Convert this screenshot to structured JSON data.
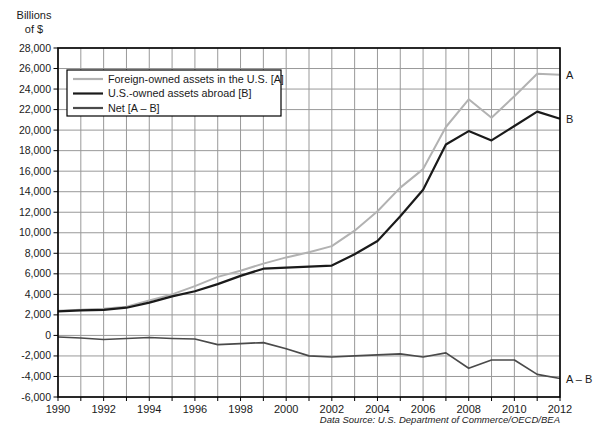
{
  "chart_data": {
    "type": "line",
    "title": "",
    "y_unit": "Billions\nof $",
    "ylabel": "Billions of $",
    "source": "Data Source: U.S. Department of Commerce/OECD/BEA",
    "x": [
      1990,
      1991,
      1992,
      1993,
      1994,
      1995,
      1996,
      1997,
      1998,
      1999,
      2000,
      2001,
      2002,
      2003,
      2004,
      2005,
      2006,
      2007,
      2008,
      2009,
      2010,
      2011,
      2012
    ],
    "x_label_step": 2,
    "ylim": [
      -6000,
      28000
    ],
    "ytick_step": 2000,
    "grid": true,
    "legend_position": "top-left",
    "colors": {
      "grid": "#999999",
      "axis": "#000000",
      "text": "#1a1a1a"
    },
    "series": [
      {
        "name": "Foreign-owned assets in the U.S. [A]",
        "end_label": "A",
        "color": "#b2b2b2",
        "width": 2.0,
        "values": [
          2400,
          2500,
          2600,
          2800,
          3400,
          4000,
          4800,
          5700,
          6300,
          7000,
          7600,
          8100,
          8700,
          10200,
          12100,
          14400,
          16200,
          20300,
          23000,
          21200,
          23300,
          25500,
          25400
        ]
      },
      {
        "name": "U.S.-owned assets abroad [B]",
        "end_label": "B",
        "color": "#1a1a1a",
        "width": 2.2,
        "values": [
          2350,
          2450,
          2500,
          2700,
          3200,
          3800,
          4300,
          5000,
          5800,
          6500,
          6600,
          6700,
          6800,
          7900,
          9200,
          11600,
          14200,
          18600,
          19900,
          19000,
          20400,
          21800,
          21100
        ]
      },
      {
        "name": "Net [A – B]",
        "end_label": "A – B",
        "color": "#4a4a4a",
        "width": 1.7,
        "values": [
          -150,
          -250,
          -400,
          -300,
          -200,
          -300,
          -350,
          -900,
          -800,
          -700,
          -1300,
          -2000,
          -2100,
          -2000,
          -1900,
          -1800,
          -2100,
          -1700,
          -3200,
          -2400,
          -2400,
          -3800,
          -4200
        ]
      }
    ]
  }
}
